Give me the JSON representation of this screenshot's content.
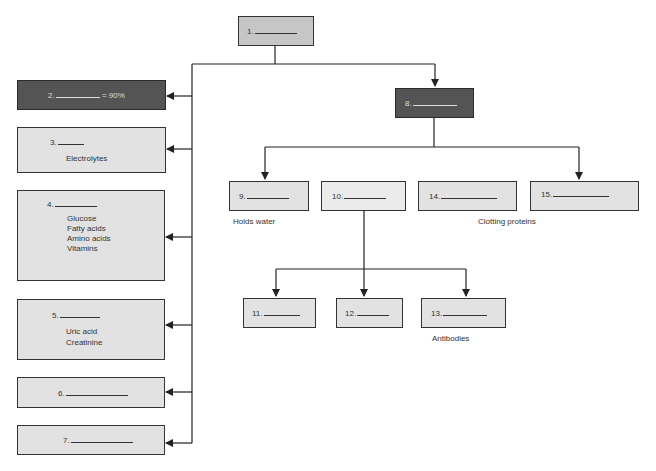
{
  "diagram": {
    "title_box": {
      "number": "1.",
      "blank_width": 44
    },
    "left_branch": [
      {
        "id": 2,
        "number": "2.",
        "suffix": " = 90%",
        "lines": [],
        "style": "dark"
      },
      {
        "id": 3,
        "number": "3.",
        "suffix": "",
        "lines": [
          "Electrolytes"
        ],
        "style": "light"
      },
      {
        "id": 4,
        "number": "4.",
        "suffix": "",
        "lines": [
          "Glucose",
          "Fatty acids",
          "Amino acids",
          "Vitamins"
        ],
        "style": "light"
      },
      {
        "id": 5,
        "number": "5.",
        "suffix": "",
        "lines": [
          "Uric acid",
          "Creatinine"
        ],
        "style": "light"
      },
      {
        "id": 6,
        "number": "6.",
        "suffix": "",
        "lines": [],
        "style": "light"
      },
      {
        "id": 7,
        "number": "7.",
        "suffix": "",
        "lines": [],
        "style": "light"
      }
    ],
    "right_branch": {
      "box8": {
        "number": "8."
      },
      "children": [
        {
          "id": 9,
          "number": "9.",
          "caption": "Holds water"
        },
        {
          "id": 10,
          "number": "10.",
          "caption": ""
        },
        {
          "id": 14,
          "number": "14.",
          "caption": ""
        },
        {
          "id": 15,
          "number": "15.",
          "caption": ""
        }
      ],
      "shared_caption_14_15": "Clotting proteins",
      "box10_children": [
        {
          "id": 11,
          "number": "11.",
          "caption": ""
        },
        {
          "id": 12,
          "number": "12.",
          "caption": ""
        },
        {
          "id": 13,
          "number": "13.",
          "caption": "Antibodies"
        }
      ]
    }
  }
}
